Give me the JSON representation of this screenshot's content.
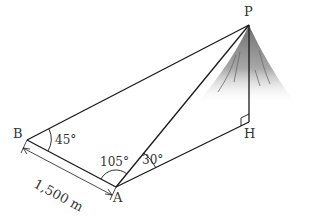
{
  "diagram": {
    "type": "surveying-triangulation",
    "points": {
      "P": {
        "label": "P",
        "desc": "mountain summit"
      },
      "H": {
        "label": "H",
        "desc": "foot of perpendicular below P"
      },
      "A": {
        "label": "A",
        "desc": "observation point"
      },
      "B": {
        "label": "B",
        "desc": "observation point"
      }
    },
    "angles": {
      "PBA": "45°",
      "BAP": "105°",
      "PAH": "30°",
      "PHA": "right angle"
    },
    "distances": {
      "AB": "1,500 m"
    },
    "colors": {
      "line": "#1a1a1a",
      "text": "#333333",
      "mountain": "#8c8c8c"
    }
  }
}
